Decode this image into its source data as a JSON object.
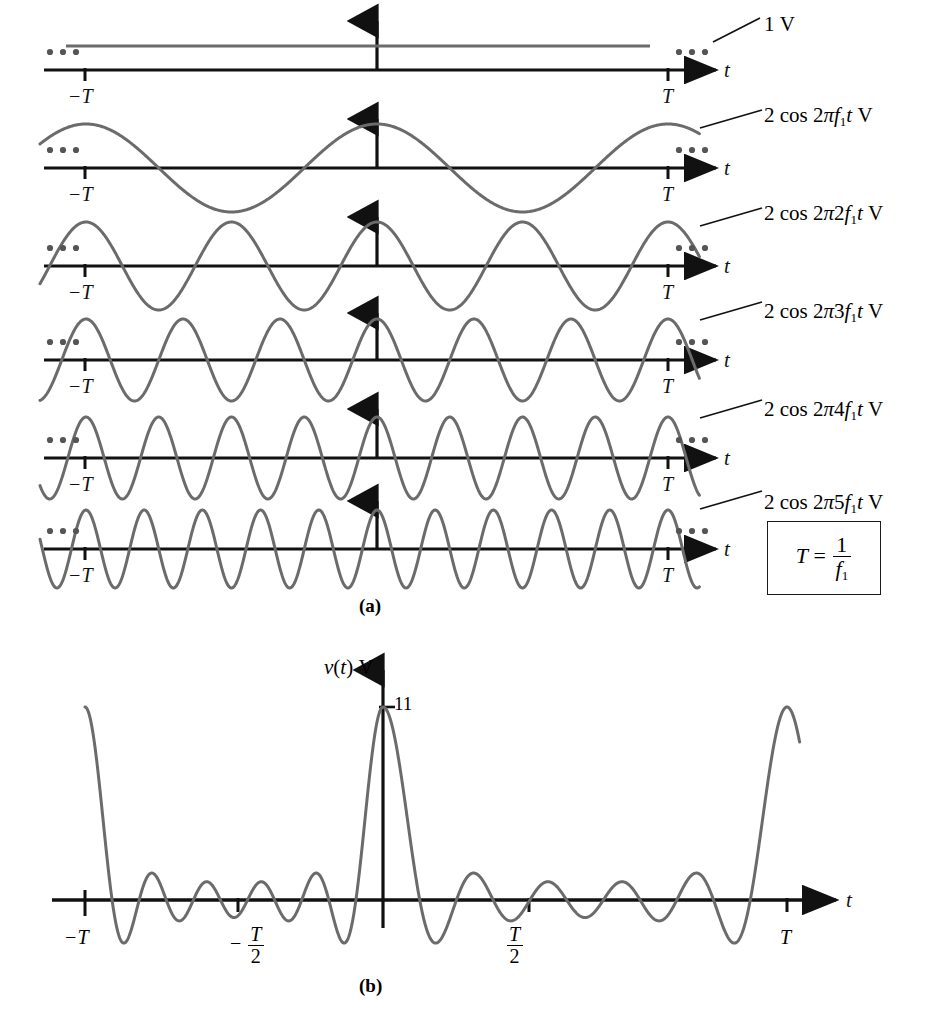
{
  "figure": {
    "panel_a_label": "(a)",
    "panel_b_label": "(b)",
    "axis_var": "t",
    "tick_left": "−T",
    "tick_right": "T",
    "boxed_equation": {
      "lhs": "T",
      "eq": "=",
      "num": "1",
      "den": "f",
      "den_sub": "1"
    }
  },
  "panel_a": {
    "rows": [
      {
        "label_prefix": "1",
        "label_suffix": "V",
        "kind": "dc",
        "amplitude": 1,
        "harmonic": 0,
        "label_text": "1 V"
      },
      {
        "label_prefix": "2 cos 2",
        "label_suffix": "V",
        "kind": "cos",
        "amplitude": 2,
        "harmonic": 1,
        "label_text": "2 cos 2πf₁t V"
      },
      {
        "label_prefix": "2 cos 2",
        "label_suffix": "V",
        "kind": "cos",
        "amplitude": 2,
        "harmonic": 2,
        "label_text": "2 cos 2π2f₁t V"
      },
      {
        "label_prefix": "2 cos 2",
        "label_suffix": "V",
        "kind": "cos",
        "amplitude": 2,
        "harmonic": 3,
        "label_text": "2 cos 2π3f₁t V"
      },
      {
        "label_prefix": "2 cos 2",
        "label_suffix": "V",
        "kind": "cos",
        "amplitude": 2,
        "harmonic": 4,
        "label_text": "2 cos 2π4f₁t V"
      },
      {
        "label_prefix": "2 cos 2",
        "label_suffix": "V",
        "kind": "cos",
        "amplitude": 2,
        "harmonic": 5,
        "label_text": "2 cos 2π5f₁t V"
      }
    ],
    "ellipsis": "• • •"
  },
  "panel_b": {
    "y_axis_label_var": "v(t)",
    "y_axis_label_unit": "V",
    "peak_value": "11",
    "ticks": [
      {
        "text": "−T",
        "kind": "plain"
      },
      {
        "text": "− T/2",
        "kind": "frac",
        "sign": "−",
        "num": "T",
        "den": "2"
      },
      {
        "text": "T/2",
        "kind": "frac",
        "sign": "",
        "num": "T",
        "den": "2"
      },
      {
        "text": "T",
        "kind": "plain"
      }
    ],
    "axis_var": "t"
  },
  "chart_data": {
    "type": "line",
    "xlabel": "t",
    "ylabel": "v(t) V",
    "x_ticks": [
      "-T",
      "-T/2",
      "0",
      "T/2",
      "T"
    ],
    "panel_a": {
      "description": "Six stacked waveforms: a 1 V DC level plus five cosine harmonics of amplitude 2 V",
      "series": [
        {
          "name": "1 V",
          "type": "dc",
          "amplitude": 1,
          "harmonic": 0,
          "cycles_per_T": 0
        },
        {
          "name": "2 cos 2πf₁t V",
          "type": "cosine",
          "amplitude": 2,
          "harmonic": 1,
          "cycles_per_T": 1
        },
        {
          "name": "2 cos 2π2f₁t V",
          "type": "cosine",
          "amplitude": 2,
          "harmonic": 2,
          "cycles_per_T": 2
        },
        {
          "name": "2 cos 2π3f₁t V",
          "type": "cosine",
          "amplitude": 2,
          "harmonic": 3,
          "cycles_per_T": 3
        },
        {
          "name": "2 cos 2π4f₁t V",
          "type": "cosine",
          "amplitude": 2,
          "harmonic": 4,
          "cycles_per_T": 4
        },
        {
          "name": "2 cos 2π5f₁t V",
          "type": "cosine",
          "amplitude": 2,
          "harmonic": 5,
          "cycles_per_T": 5
        }
      ],
      "relation": "T = 1/f₁",
      "xlim": [
        "-1.25T",
        "1.25T"
      ],
      "grid": false,
      "legend": "inline-right"
    },
    "panel_b": {
      "description": "Sum of the six components: Dirichlet kernel v(t) = 1 + 2Σ cos(2πkf₁t), k=1..5",
      "formula": "v(t) = 1 + 2cos2πf₁t + 2cos2π2f₁t + 2cos2π3f₁t + 2cos2π4f₁t + 2cos2π5f₁t",
      "peak_value": 11,
      "peak_at": 0,
      "xlim": [
        "-T",
        "T"
      ],
      "ylim": [
        -2,
        11
      ],
      "grid": false,
      "annotations": [
        {
          "text": "11",
          "x": 0,
          "y": 11
        }
      ]
    }
  },
  "style": {
    "wave_color": "#6b6b6b",
    "axis_color": "#111111",
    "text_color": "#111111",
    "background": "#ffffff"
  }
}
